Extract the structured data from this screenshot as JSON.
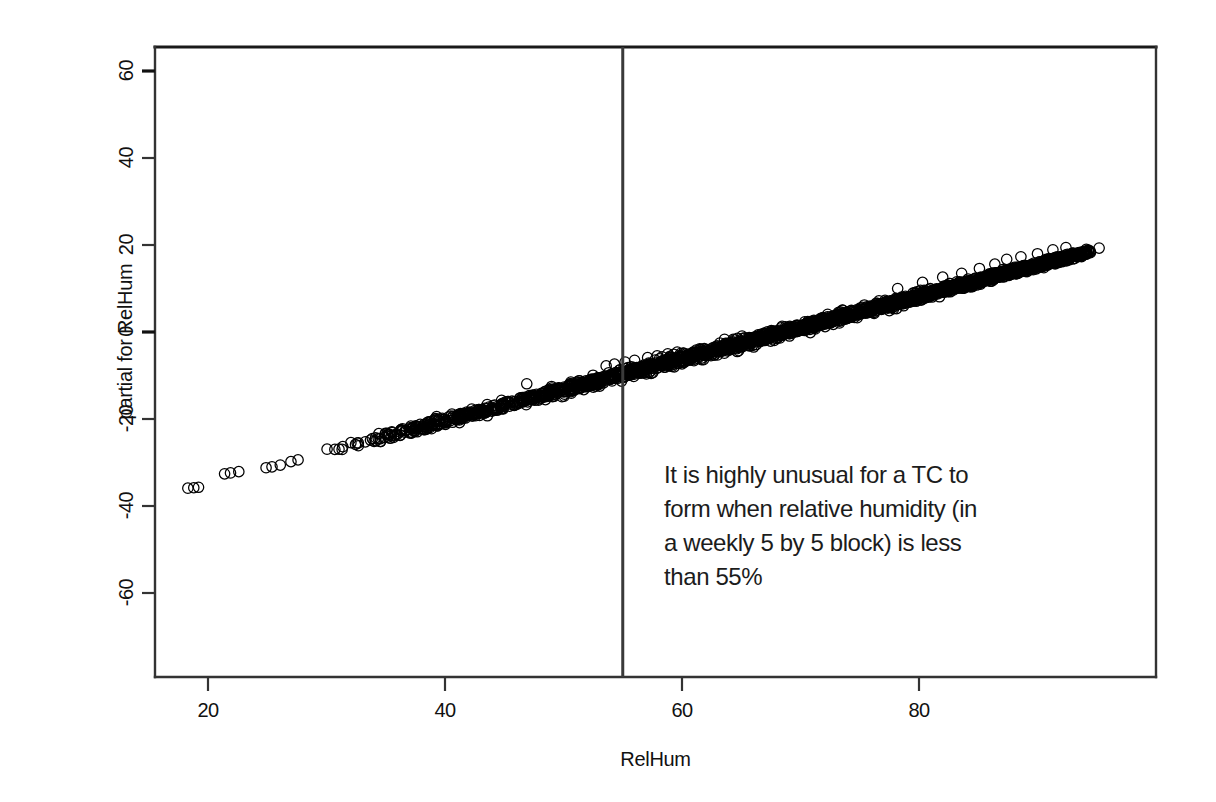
{
  "chart_data": {
    "type": "scatter",
    "title": "",
    "xlabel": "RelHum",
    "ylabel": "partial for RelHum",
    "xlim": [
      16,
      97
    ],
    "ylim": [
      -70,
      63
    ],
    "xticks": [
      20,
      40,
      60,
      80
    ],
    "yticks": [
      -60,
      -40,
      -20,
      0,
      20,
      40,
      60
    ],
    "grid": false,
    "legend": null,
    "marker": "open-circle",
    "marker_color": "#000000",
    "fit": {
      "slope": 0.715,
      "intercept": -49.0,
      "x_start": 18.0,
      "x_end": 95.5,
      "y_start": -36.1,
      "y_end": 19.3,
      "band_halfwidth": 1.1
    },
    "n_points_approx": 1400,
    "sparse_tail_points": [
      {
        "x": 18.3,
        "y": -35.9
      },
      {
        "x": 18.8,
        "y": -35.8
      },
      {
        "x": 19.2,
        "y": -35.7
      },
      {
        "x": 21.4,
        "y": -32.6
      },
      {
        "x": 21.9,
        "y": -32.4
      },
      {
        "x": 22.6,
        "y": -32.1
      },
      {
        "x": 24.9,
        "y": -31.2
      },
      {
        "x": 25.4,
        "y": -31.0
      },
      {
        "x": 26.1,
        "y": -30.6
      },
      {
        "x": 27.0,
        "y": -29.8
      },
      {
        "x": 27.6,
        "y": -29.4
      }
    ],
    "above_band_outliers": [
      {
        "x": 46.9,
        "y": -11.9
      },
      {
        "x": 53.6,
        "y": -7.8
      },
      {
        "x": 54.3,
        "y": -7.4
      },
      {
        "x": 55.2,
        "y": -6.9
      },
      {
        "x": 56.0,
        "y": -6.5
      },
      {
        "x": 57.1,
        "y": -5.9
      },
      {
        "x": 57.9,
        "y": -5.5
      },
      {
        "x": 58.8,
        "y": -5.0
      },
      {
        "x": 59.6,
        "y": -4.6
      },
      {
        "x": 78.2,
        "y": 10.0
      },
      {
        "x": 80.3,
        "y": 11.4
      },
      {
        "x": 82.0,
        "y": 12.6
      },
      {
        "x": 83.6,
        "y": 13.5
      },
      {
        "x": 85.1,
        "y": 14.6
      },
      {
        "x": 86.4,
        "y": 15.6
      },
      {
        "x": 87.4,
        "y": 16.7
      },
      {
        "x": 88.6,
        "y": 17.3
      },
      {
        "x": 90.0,
        "y": 18.0
      },
      {
        "x": 91.3,
        "y": 18.9
      },
      {
        "x": 92.4,
        "y": 19.4
      },
      {
        "x": 95.2,
        "y": 19.3
      }
    ],
    "reference_line": {
      "orientation": "vertical",
      "x": 55,
      "color": "#3a3a3a",
      "label": "RelHum = 55"
    },
    "annotation": {
      "lines": [
        "It is highly unusual for a TC to",
        "form when relative humidity (in",
        "a weekly 5 by 5 block) is less",
        "than 55%"
      ],
      "x": 57,
      "y": -30
    }
  },
  "axes": {
    "x_tick_labels": [
      "20",
      "40",
      "60",
      "80"
    ],
    "y_tick_labels": [
      "-60",
      "-40",
      "-20",
      "0",
      "20",
      "40",
      "60"
    ],
    "x_axis_title": "RelHum",
    "y_axis_title": "partial for RelHum"
  },
  "colors": {
    "frame": "#333333",
    "points": "#000000",
    "reference_line": "#3a3a3a",
    "text": "#111111",
    "background": "#ffffff"
  }
}
